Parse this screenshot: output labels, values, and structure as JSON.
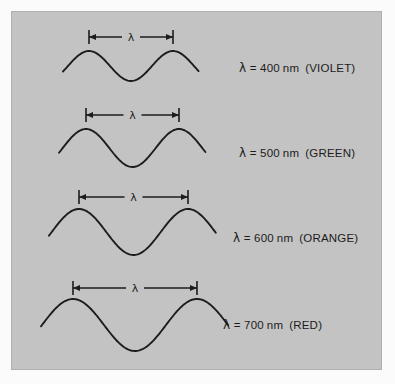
{
  "figure": {
    "background_color": "#c3c3c3",
    "stroke_color": "#1c1c1c",
    "page_color": "#fbfbfb",
    "lambda_symbol": "λ",
    "dimension_label": "λ"
  },
  "chart_data": {
    "type": "line",
    "title": "",
    "xlabel": "",
    "ylabel": "",
    "series": [
      {
        "name": "violet",
        "wavelength_nm": 400,
        "color_name": "VIOLET",
        "label": "λ = 400 nm  (VIOLET)",
        "label_value": "400",
        "label_unit": "nm",
        "label_color": "(VIOLET)",
        "period_px": 84,
        "amplitude_px": 15,
        "baseline_y": 65,
        "dim_left_x": 88,
        "dim_right_x": 172,
        "dim_y": 36,
        "wave_start_x": 62,
        "wave_end_x": 198,
        "label_x": 238,
        "label_y": 60
      },
      {
        "name": "green",
        "wavelength_nm": 500,
        "color_name": "GREEN",
        "label": "λ = 500 nm  (GREEN)",
        "label_value": "500",
        "label_unit": "nm",
        "label_color": "(GREEN)",
        "period_px": 93,
        "amplitude_px": 19,
        "baseline_y": 147,
        "dim_left_x": 85,
        "dim_right_x": 178,
        "dim_y": 114,
        "wave_start_x": 58,
        "wave_end_x": 205,
        "label_x": 238,
        "label_y": 145
      },
      {
        "name": "orange",
        "wavelength_nm": 600,
        "color_name": "ORANGE",
        "label": "λ = 600 nm  (ORANGE)",
        "label_value": "600",
        "label_unit": "nm",
        "label_color": "(ORANGE)",
        "period_px": 109,
        "amplitude_px": 23,
        "baseline_y": 231,
        "dim_left_x": 78,
        "dim_right_x": 187,
        "dim_y": 196,
        "wave_start_x": 48,
        "wave_end_x": 215,
        "label_x": 232,
        "label_y": 230
      },
      {
        "name": "red",
        "wavelength_nm": 700,
        "color_name": "RED",
        "label": "λ = 700 nm (RED)",
        "label_value": "700",
        "label_unit": "nm",
        "label_color": "(RED)",
        "period_px": 124,
        "amplitude_px": 26,
        "baseline_y": 324,
        "dim_left_x": 72,
        "dim_right_x": 196,
        "dim_y": 287,
        "wave_start_x": 40,
        "wave_end_x": 228,
        "label_x": 222,
        "label_y": 317
      }
    ]
  }
}
